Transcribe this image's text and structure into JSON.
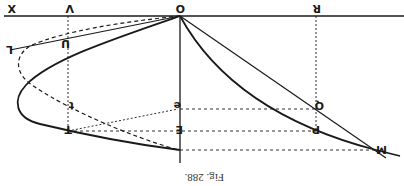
{
  "figure": {
    "caption": "Fig. 288.",
    "orientation": "rotated-180",
    "labels": {
      "X": "X",
      "V": "V",
      "O": "O",
      "R": "R",
      "U": "U",
      "L": "L",
      "t": "t",
      "T": "T",
      "e": "e",
      "E": "E",
      "Q": "Q",
      "P": "P",
      "M": "M"
    },
    "colors": {
      "ink": "#1a1a1a",
      "paper": "#ffffff"
    }
  }
}
